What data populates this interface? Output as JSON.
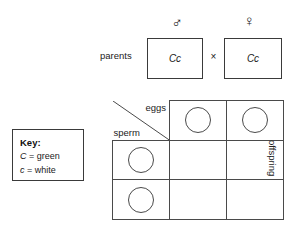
{
  "diagram": {
    "type": "punnett-square",
    "parents": {
      "label": "parents",
      "cross_symbol": "×",
      "father": {
        "sex_symbol": "♂",
        "sex_name": "male",
        "genotype": "Cc"
      },
      "mother": {
        "sex_symbol": "♀",
        "sex_name": "female",
        "genotype": "Cc"
      }
    },
    "key": {
      "title": "Key:",
      "entries": [
        {
          "allele": "C",
          "equals": "=",
          "phenotype": "green"
        },
        {
          "allele": "c",
          "equals": "=",
          "phenotype": "white"
        }
      ]
    },
    "grid": {
      "columns_axis_label": "eggs",
      "rows_axis_label": "sperm",
      "offspring_label": "offspring",
      "column_gametes": [
        "",
        ""
      ],
      "row_gametes": [
        "",
        ""
      ],
      "offspring_cells": [
        [
          "",
          ""
        ],
        [
          "",
          ""
        ]
      ]
    }
  },
  "watermark": {
    "top": "",
    "bottom": ""
  },
  "colors": {
    "line": "#4a4a4a",
    "text": "#1a1a1a",
    "background": "#ffffff"
  }
}
